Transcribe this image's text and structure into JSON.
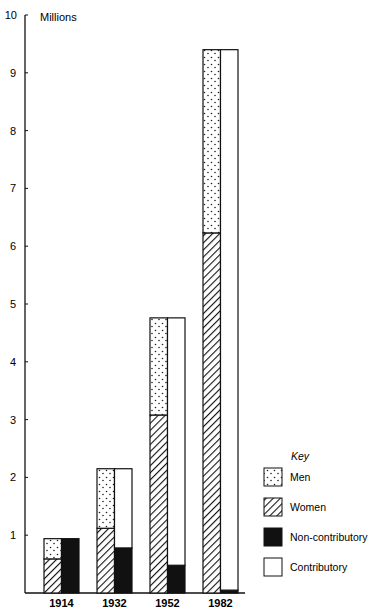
{
  "chart_data": {
    "type": "bar",
    "title": "",
    "ylabel": "Millions",
    "xlabel": "",
    "ylim": [
      0,
      10
    ],
    "yticks": [
      1,
      2,
      3,
      4,
      5,
      6,
      7,
      8,
      9,
      10
    ],
    "categories": [
      "1914",
      "1932",
      "1952",
      "1982"
    ],
    "grid": false,
    "legend_position": "right-bottom",
    "legend_title": "Key",
    "stacks": [
      {
        "name": "By sex (left bar)",
        "series": [
          {
            "name": "Women",
            "pattern": "diagonal-hatch",
            "values": [
              0.59,
              1.12,
              3.08,
              6.23
            ]
          },
          {
            "name": "Men",
            "pattern": "dotted",
            "values": [
              0.35,
              1.03,
              1.68,
              3.17
            ]
          }
        ]
      },
      {
        "name": "By type (right bar)",
        "series": [
          {
            "name": "Non-contributory",
            "pattern": "solid-black",
            "values": [
              0.94,
              0.78,
              0.48,
              0.05
            ]
          },
          {
            "name": "Contributory",
            "pattern": "white",
            "values": [
              0.0,
              1.37,
              4.28,
              9.35
            ]
          }
        ]
      }
    ],
    "totals": [
      0.94,
      2.15,
      4.76,
      9.4
    ]
  },
  "legend": {
    "title": "Key",
    "items": [
      {
        "label": "Men",
        "pattern": "dots"
      },
      {
        "label": "Women",
        "pattern": "hatch"
      },
      {
        "label": "Non-contributory",
        "pattern": "black"
      },
      {
        "label": "Contributory",
        "pattern": "white"
      }
    ]
  },
  "axis": {
    "unit_label": "Millions"
  }
}
